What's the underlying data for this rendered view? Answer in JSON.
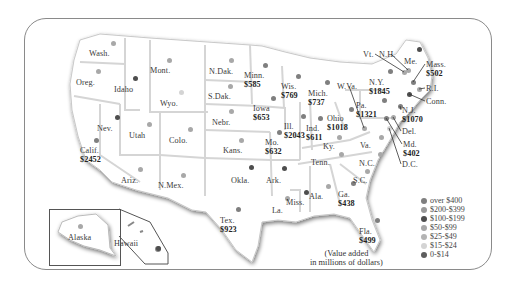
{
  "note": {
    "line1": "(Value added",
    "line2": "in millions of dollars)"
  },
  "legend": [
    {
      "label": "over $400",
      "color": "#7f7f7f"
    },
    {
      "label": "$200-$399",
      "color": "#9a9a9a"
    },
    {
      "label": "$100-$199",
      "color": "#4e4e4e"
    },
    {
      "label": "$50-$99",
      "color": "#a8a8a8"
    },
    {
      "label": "$25-$49",
      "color": "#b4b4b4"
    },
    {
      "label": "$15-$24",
      "color": "#d4d4d4"
    },
    {
      "label": "0-$14",
      "color": "#5e5e5e"
    }
  ],
  "states": [
    {
      "name": "Wash.",
      "x": 99,
      "y": 49,
      "dx": 113,
      "dy": 43,
      "cat": 3
    },
    {
      "name": "Oreg.",
      "x": 86,
      "y": 78,
      "dx": 98,
      "dy": 71,
      "cat": 3
    },
    {
      "name": "Idaho",
      "x": 124,
      "y": 85,
      "dx": 135,
      "dy": 78,
      "cat": 2
    },
    {
      "name": "Mont.",
      "x": 160,
      "y": 66,
      "dx": 169,
      "dy": 60,
      "cat": 3
    },
    {
      "name": "Wyo.",
      "x": 170,
      "y": 99,
      "dx": 181,
      "dy": 92,
      "cat": 5
    },
    {
      "name": "Nev.",
      "x": 107,
      "y": 124,
      "dx": 117,
      "dy": 117,
      "cat": 2
    },
    {
      "name": "Utah",
      "x": 139,
      "y": 131,
      "dx": 149,
      "dy": 124,
      "cat": 3
    },
    {
      "name": "Colo.",
      "x": 179,
      "y": 136,
      "dx": 190,
      "dy": 129,
      "cat": 3
    },
    {
      "name": "N.Dak.",
      "x": 219,
      "y": 67,
      "dx": 231,
      "dy": 60,
      "cat": 3
    },
    {
      "name": "S.Dak.",
      "x": 218,
      "y": 92,
      "dx": 230,
      "dy": 86,
      "cat": 3
    },
    {
      "name": "Nebr.",
      "x": 222,
      "y": 118,
      "dx": 231,
      "dy": 111,
      "cat": 3
    },
    {
      "name": "Kans.",
      "x": 233,
      "y": 146,
      "dx": 241,
      "dy": 140,
      "cat": 3
    },
    {
      "name": "Okla.",
      "x": 241,
      "y": 176,
      "dx": 251,
      "dy": 167,
      "cat": 2
    },
    {
      "name": "N.Mex.",
      "x": 168,
      "y": 181,
      "dx": 183,
      "dy": 175,
      "cat": 3
    },
    {
      "name": "Ariz.",
      "x": 131,
      "y": 176,
      "dx": 140,
      "dy": 169,
      "cat": 3
    },
    {
      "name": "Calif.",
      "value": "$2452",
      "x": 90,
      "y": 146,
      "dx": 96,
      "dy": 140,
      "cat": 0
    },
    {
      "name": "Tex.",
      "value": "$923",
      "x": 230,
      "y": 216,
      "dx": 238,
      "dy": 209,
      "cat": 0
    },
    {
      "name": "Minn.",
      "value": "$585",
      "x": 254,
      "y": 71,
      "dx": 265,
      "dy": 65,
      "cat": 0
    },
    {
      "name": "Iowa",
      "value": "$653",
      "x": 263,
      "y": 104,
      "dx": 273,
      "dy": 98,
      "cat": 0
    },
    {
      "name": "Mo.",
      "value": "$632",
      "x": 275,
      "y": 138,
      "dx": 279,
      "dy": 132,
      "cat": 0
    },
    {
      "name": "Wis.",
      "value": "$769",
      "x": 291,
      "y": 82,
      "dx": 298,
      "dy": 76,
      "cat": 0
    },
    {
      "name": "Ill.",
      "value": "$2043",
      "x": 294,
      "y": 122,
      "dx": 303,
      "dy": 116,
      "cat": 0
    },
    {
      "name": "Mich.",
      "value": "$737",
      "x": 318,
      "y": 89,
      "dx": 327,
      "dy": 82,
      "cat": 0
    },
    {
      "name": "Ind.",
      "value": "$611",
      "x": 316,
      "y": 124,
      "dx": 320,
      "dy": 118,
      "cat": 0
    },
    {
      "name": "Ohio",
      "value": "$1018",
      "x": 337,
      "y": 114,
      "dx": 351,
      "dy": 109,
      "cat": 0
    },
    {
      "name": "Ky.",
      "x": 333,
      "y": 142,
      "dx": 339,
      "dy": 137,
      "cat": 3
    },
    {
      "name": "Tenn.",
      "x": 321,
      "y": 158,
      "dx": 341,
      "dy": 154,
      "cat": 3
    },
    {
      "name": "Ark.",
      "x": 276,
      "y": 176,
      "dx": 284,
      "dy": 168,
      "cat": 2
    },
    {
      "name": "La.",
      "x": 282,
      "y": 206,
      "dx": 287,
      "dy": 198,
      "cat": 3
    },
    {
      "name": "Miss.",
      "x": 296,
      "y": 198,
      "dx": 306,
      "dy": 192,
      "cat": 2
    },
    {
      "name": "Ala.",
      "x": 319,
      "y": 192,
      "dx": 328,
      "dy": 186,
      "cat": 3
    },
    {
      "name": "Ga.",
      "value": "$438",
      "x": 348,
      "y": 190,
      "dx": 353,
      "dy": 183,
      "cat": 0
    },
    {
      "name": "Fla.",
      "value": "$499",
      "x": 369,
      "y": 227,
      "dx": 377,
      "dy": 220,
      "cat": 0
    },
    {
      "name": "S.C.",
      "x": 363,
      "y": 176,
      "dx": 367,
      "dy": 171,
      "cat": 3
    },
    {
      "name": "N.C.",
      "x": 369,
      "y": 159,
      "dx": 380,
      "dy": 154,
      "cat": 3
    },
    {
      "name": "Va.",
      "x": 370,
      "y": 141,
      "dx": 381,
      "dy": 137,
      "cat": 3
    },
    {
      "name": "W.Va.",
      "x": 347,
      "y": 82,
      "dx": 364,
      "dy": 128,
      "cat": 3
    },
    {
      "name": "Pa.",
      "value": "$1321",
      "x": 366,
      "y": 101,
      "dx": 384,
      "dy": 100,
      "cat": 0
    },
    {
      "name": "N.Y.",
      "value": "$1845",
      "x": 379,
      "y": 78,
      "dx": 390,
      "dy": 71,
      "cat": 0
    },
    {
      "name": "Vt.",
      "x": 373,
      "y": 50,
      "dx": 404,
      "dy": 72,
      "cat": 3
    },
    {
      "name": "N.H.",
      "x": 389,
      "y": 50,
      "dx": 408,
      "dy": 70,
      "cat": 3
    },
    {
      "name": "Me.",
      "x": 414,
      "y": 57,
      "dx": 419,
      "dy": 49,
      "cat": 2
    },
    {
      "name": "Mass.",
      "value": "$502",
      "x": 436,
      "y": 60,
      "dx": 413,
      "dy": 82,
      "cat": 0
    },
    {
      "name": "R.I.",
      "x": 436,
      "y": 84,
      "dx": 419,
      "dy": 89,
      "cat": 3
    },
    {
      "name": "Conn.",
      "x": 436,
      "y": 97,
      "dx": 409,
      "dy": 94,
      "cat": 2
    },
    {
      "name": "N.J.",
      "value": "$1070",
      "x": 412,
      "y": 106,
      "dx": 400,
      "dy": 106,
      "cat": 0
    },
    {
      "name": "Del.",
      "x": 412,
      "y": 127,
      "dx": 393,
      "dy": 117,
      "cat": 3
    },
    {
      "name": "Md.",
      "value": "$402",
      "x": 413,
      "y": 140,
      "dx": 386,
      "dy": 118,
      "cat": 0
    },
    {
      "name": "D.C.",
      "x": 412,
      "y": 160,
      "dx": 389,
      "dy": 128,
      "cat": 5
    },
    {
      "name": "Alaska",
      "x": 78,
      "y": 233,
      "dx": 80,
      "dy": 226,
      "cat": 3
    },
    {
      "name": "Hawaii",
      "x": 124,
      "y": 239,
      "dx": 158,
      "dy": 248,
      "cat": 2
    }
  ]
}
